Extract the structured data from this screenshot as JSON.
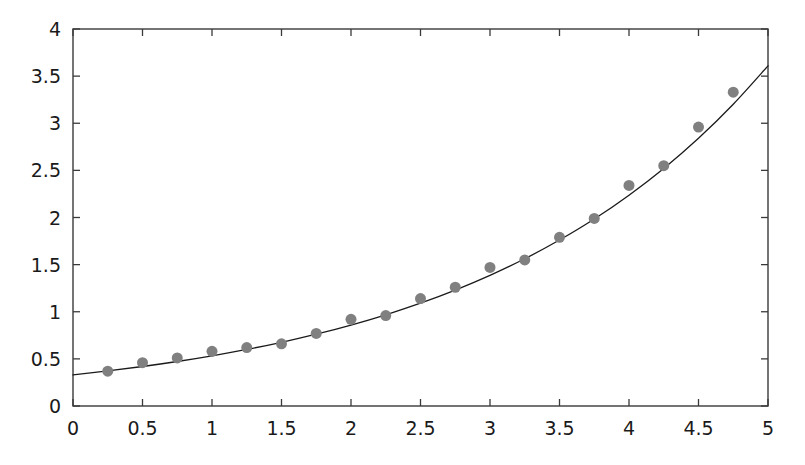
{
  "chart_data": {
    "type": "scatter",
    "title": "",
    "subtitle": "",
    "xlabel": "",
    "ylabel": "",
    "xlim": [
      0,
      5
    ],
    "ylim": [
      0,
      4
    ],
    "grid": false,
    "legend": null,
    "legend_position": "none",
    "annotations": [],
    "xticks": [
      0,
      0.5,
      1,
      1.5,
      2,
      2.5,
      3,
      3.5,
      4,
      4.5,
      5
    ],
    "xticklabels": [
      "0",
      "0.5",
      "1",
      "1.5",
      "2",
      "2.5",
      "3",
      "3.5",
      "4",
      "4.5",
      "5"
    ],
    "yticks": [
      0,
      0.5,
      1,
      1.5,
      2,
      2.5,
      3,
      3.5,
      4
    ],
    "yticklabels": [
      "0",
      "0.5",
      "1",
      "1.5",
      "2",
      "2.5",
      "3",
      "3.5",
      "4"
    ],
    "series": [
      {
        "name": "data points",
        "type": "scatter",
        "marker": "circle",
        "color": "#808080",
        "marker_size": 11,
        "x": [
          0.25,
          0.5,
          0.75,
          1.0,
          1.25,
          1.5,
          1.75,
          2.0,
          2.25,
          2.5,
          2.75,
          3.0,
          3.25,
          3.5,
          3.75,
          4.0,
          4.25,
          4.5,
          4.75
        ],
        "y": [
          0.37,
          0.46,
          0.51,
          0.58,
          0.62,
          0.66,
          0.77,
          0.92,
          0.96,
          1.14,
          1.26,
          1.47,
          1.55,
          1.79,
          1.99,
          2.34,
          2.55,
          2.96,
          3.33
        ]
      },
      {
        "name": "fitted curve",
        "type": "line",
        "color": "#1a1a1a",
        "line_width": 1.3,
        "x": [
          0.0,
          0.25,
          0.5,
          0.75,
          1.0,
          1.25,
          1.5,
          1.75,
          2.0,
          2.25,
          2.5,
          2.75,
          3.0,
          3.25,
          3.5,
          3.75,
          4.0,
          4.25,
          4.5,
          4.75,
          5.0
        ],
        "y": [
          0.33,
          0.372,
          0.419,
          0.472,
          0.532,
          0.6,
          0.676,
          0.762,
          0.859,
          0.968,
          1.091,
          1.23,
          1.386,
          1.562,
          1.761,
          1.984,
          2.237,
          2.521,
          2.841,
          3.202,
          3.609
        ]
      }
    ]
  },
  "style": {
    "background": "#ffffff",
    "axis_color": "#3a3a3a",
    "tick_color": "#3a3a3a",
    "text_color": "#1a1a1a",
    "marker_color": "#808080",
    "line_color": "#1a1a1a"
  },
  "geometry": {
    "plot_left": 73,
    "plot_right": 768,
    "plot_top": 29,
    "plot_bottom": 406
  }
}
